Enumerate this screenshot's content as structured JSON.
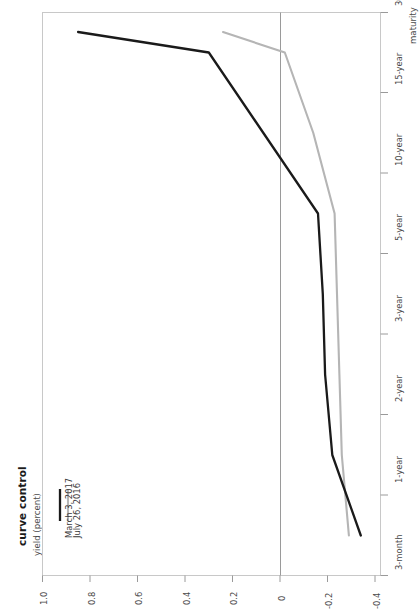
{
  "chart_data": {
    "type": "line",
    "title": "curve control",
    "subtitle": "",
    "xlabel": "maturity",
    "ylabel": "yield (percent)",
    "orientation": "rotated-90-counterclockwise",
    "grid": false,
    "legend_position": "inside-left",
    "categories": [
      "3-month",
      "1-year",
      "2-year",
      "3-year",
      "5-year",
      "10-year",
      "15-year",
      "30-year"
    ],
    "ylim": [
      -0.4,
      1.0
    ],
    "yticks": [
      "1.0",
      "0.8",
      "0.6",
      "0.4",
      "0.2",
      "0",
      "-0.2",
      "-0.4"
    ],
    "ytick_values": [
      1.0,
      0.8,
      0.6,
      0.4,
      0.2,
      0,
      -0.2,
      -0.4
    ],
    "zero_line": 0,
    "series": [
      {
        "name": "March 3, 2017",
        "color": "#1a1a1a",
        "values": [
          -0.34,
          -0.22,
          -0.19,
          -0.18,
          -0.16,
          0.07,
          0.3,
          0.85
        ]
      },
      {
        "name": "July 26, 2016",
        "color": "#b5b5b5",
        "values": [
          -0.29,
          -0.26,
          -0.25,
          -0.24,
          -0.23,
          -0.14,
          -0.02,
          0.24
        ]
      }
    ]
  },
  "axes": {
    "y_ticks": [
      {
        "label": "1.0"
      },
      {
        "label": "0.8"
      },
      {
        "label": "0.6"
      },
      {
        "label": "0.4"
      },
      {
        "label": "0.2"
      },
      {
        "label": "0"
      },
      {
        "label": "-0.2"
      },
      {
        "label": "-0.4"
      }
    ],
    "x_ticks": [
      {
        "label": "3-month"
      },
      {
        "label": "1-year"
      },
      {
        "label": "2-year"
      },
      {
        "label": "3-year"
      },
      {
        "label": "5-year"
      },
      {
        "label": "10-year"
      },
      {
        "label": "15-year"
      },
      {
        "label": "30-year"
      }
    ]
  },
  "legend": {
    "entries": [
      {
        "label": "March 3, 2017",
        "color": "#1a1a1a"
      },
      {
        "label": "July 26, 2016",
        "color": "#b5b5b5"
      }
    ]
  },
  "colors": {
    "series_1": "#1a1a1a",
    "series_2": "#b5b5b5",
    "frame": "#c8c8c8",
    "zero_line": "#9a9a9a",
    "text": "#3a3a3a"
  }
}
